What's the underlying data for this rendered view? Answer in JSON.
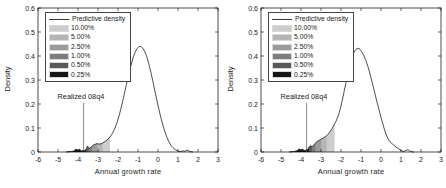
{
  "figure": {
    "background": "#ffffff",
    "text_color": "#1a1a1a"
  },
  "chart_data": [
    {
      "type": "line",
      "title": "",
      "xlabel": "Annual growth rate",
      "ylabel": "Density",
      "xlim": [
        -6,
        3
      ],
      "ylim": [
        0,
        0.6
      ],
      "xticks": [
        -6,
        -5,
        -4,
        -3,
        -2,
        -1,
        0,
        1,
        2,
        3
      ],
      "yticks": [
        0,
        0.1,
        0.2,
        0.3,
        0.4,
        0.5,
        0.6
      ],
      "grid": false,
      "legend": {
        "position": "upper-left",
        "line_label": "Predictive density",
        "bands": [
          {
            "label": "10.00%",
            "color": "#cdcdcd",
            "upper_x": -2.4
          },
          {
            "label": "5.00%",
            "color": "#b5b5b5",
            "upper_x": -2.78
          },
          {
            "label": "2.50%",
            "color": "#9b9b9b",
            "upper_x": -3.05
          },
          {
            "label": "1.00%",
            "color": "#7d7d7d",
            "upper_x": -3.3
          },
          {
            "label": "0.50%",
            "color": "#595959",
            "upper_x": -3.48
          },
          {
            "label": "0.25%",
            "color": "#161616",
            "upper_x": -3.62
          }
        ]
      },
      "annotation": {
        "text": "Realized 08q4",
        "x": -3.72,
        "line_top_y": 0.205
      },
      "curve": {
        "name": "Predictive density",
        "color": "#3a3a3a",
        "points": [
          [
            -4.6,
            0.0
          ],
          [
            -4.35,
            0.002
          ],
          [
            -4.2,
            0.004
          ],
          [
            -4.1,
            0.013
          ],
          [
            -4.0,
            0.006
          ],
          [
            -3.92,
            0.012
          ],
          [
            -3.85,
            0.004
          ],
          [
            -3.7,
            0.006
          ],
          [
            -3.6,
            0.01
          ],
          [
            -3.52,
            0.024
          ],
          [
            -3.45,
            0.014
          ],
          [
            -3.35,
            0.02
          ],
          [
            -3.25,
            0.028
          ],
          [
            -3.15,
            0.032
          ],
          [
            -3.05,
            0.035
          ],
          [
            -2.95,
            0.033
          ],
          [
            -2.85,
            0.034
          ],
          [
            -2.75,
            0.038
          ],
          [
            -2.65,
            0.044
          ],
          [
            -2.55,
            0.05
          ],
          [
            -2.45,
            0.058
          ],
          [
            -2.35,
            0.068
          ],
          [
            -2.25,
            0.082
          ],
          [
            -2.15,
            0.1
          ],
          [
            -2.05,
            0.122
          ],
          [
            -1.95,
            0.15
          ],
          [
            -1.85,
            0.182
          ],
          [
            -1.75,
            0.218
          ],
          [
            -1.65,
            0.255
          ],
          [
            -1.55,
            0.292
          ],
          [
            -1.45,
            0.328
          ],
          [
            -1.35,
            0.362
          ],
          [
            -1.25,
            0.392
          ],
          [
            -1.15,
            0.414
          ],
          [
            -1.05,
            0.43
          ],
          [
            -0.95,
            0.439
          ],
          [
            -0.85,
            0.44
          ],
          [
            -0.75,
            0.432
          ],
          [
            -0.65,
            0.416
          ],
          [
            -0.55,
            0.394
          ],
          [
            -0.45,
            0.364
          ],
          [
            -0.35,
            0.33
          ],
          [
            -0.25,
            0.292
          ],
          [
            -0.15,
            0.252
          ],
          [
            -0.05,
            0.213
          ],
          [
            0.05,
            0.176
          ],
          [
            0.15,
            0.141
          ],
          [
            0.25,
            0.11
          ],
          [
            0.35,
            0.083
          ],
          [
            0.45,
            0.06
          ],
          [
            0.55,
            0.042
          ],
          [
            0.65,
            0.028
          ],
          [
            0.75,
            0.018
          ],
          [
            0.85,
            0.011
          ],
          [
            0.95,
            0.006
          ],
          [
            1.05,
            0.003
          ],
          [
            1.15,
            0.002
          ],
          [
            1.25,
            0.005
          ],
          [
            1.35,
            0.003
          ],
          [
            1.45,
            0.008
          ],
          [
            1.55,
            0.004
          ],
          [
            1.65,
            0.001
          ],
          [
            1.75,
            0.0
          ]
        ]
      }
    },
    {
      "type": "line",
      "title": "",
      "xlabel": "Annual growth rate",
      "ylabel": "Density",
      "xlim": [
        -6,
        3
      ],
      "ylim": [
        0,
        0.6
      ],
      "xticks": [
        -6,
        -5,
        -4,
        -3,
        -2,
        -1,
        0,
        1,
        2,
        3
      ],
      "yticks": [
        0,
        0.1,
        0.2,
        0.3,
        0.4,
        0.5,
        0.6
      ],
      "grid": false,
      "legend": {
        "position": "upper-left",
        "line_label": "Predictive density",
        "bands": [
          {
            "label": "10.00%",
            "color": "#cdcdcd",
            "upper_x": -2.32
          },
          {
            "label": "5.00%",
            "color": "#b5b5b5",
            "upper_x": -2.72
          },
          {
            "label": "2.50%",
            "color": "#9b9b9b",
            "upper_x": -3.0
          },
          {
            "label": "1.00%",
            "color": "#7d7d7d",
            "upper_x": -3.28
          },
          {
            "label": "0.50%",
            "color": "#595959",
            "upper_x": -3.46
          },
          {
            "label": "0.25%",
            "color": "#161616",
            "upper_x": -3.6
          }
        ]
      },
      "annotation": {
        "text": "Realized 08q4",
        "x": -3.72,
        "line_top_y": 0.205
      },
      "curve": {
        "name": "Predictive density",
        "color": "#3a3a3a",
        "points": [
          [
            -4.6,
            0.0
          ],
          [
            -4.35,
            0.002
          ],
          [
            -4.2,
            0.005
          ],
          [
            -4.1,
            0.013
          ],
          [
            -4.0,
            0.007
          ],
          [
            -3.92,
            0.012
          ],
          [
            -3.85,
            0.006
          ],
          [
            -3.75,
            0.008
          ],
          [
            -3.65,
            0.012
          ],
          [
            -3.55,
            0.026
          ],
          [
            -3.45,
            0.022
          ],
          [
            -3.35,
            0.03
          ],
          [
            -3.25,
            0.04
          ],
          [
            -3.15,
            0.046
          ],
          [
            -3.05,
            0.051
          ],
          [
            -2.95,
            0.056
          ],
          [
            -2.85,
            0.06
          ],
          [
            -2.75,
            0.066
          ],
          [
            -2.65,
            0.074
          ],
          [
            -2.55,
            0.084
          ],
          [
            -2.45,
            0.097
          ],
          [
            -2.35,
            0.112
          ],
          [
            -2.25,
            0.128
          ],
          [
            -2.15,
            0.148
          ],
          [
            -2.05,
            0.175
          ],
          [
            -1.95,
            0.21
          ],
          [
            -1.85,
            0.25
          ],
          [
            -1.75,
            0.29
          ],
          [
            -1.65,
            0.328
          ],
          [
            -1.55,
            0.362
          ],
          [
            -1.45,
            0.392
          ],
          [
            -1.35,
            0.415
          ],
          [
            -1.25,
            0.428
          ],
          [
            -1.15,
            0.433
          ],
          [
            -1.05,
            0.428
          ],
          [
            -0.95,
            0.416
          ],
          [
            -0.85,
            0.4
          ],
          [
            -0.75,
            0.38
          ],
          [
            -0.65,
            0.355
          ],
          [
            -0.55,
            0.325
          ],
          [
            -0.45,
            0.293
          ],
          [
            -0.35,
            0.259
          ],
          [
            -0.25,
            0.225
          ],
          [
            -0.15,
            0.192
          ],
          [
            -0.05,
            0.16
          ],
          [
            0.05,
            0.129
          ],
          [
            0.15,
            0.1
          ],
          [
            0.25,
            0.075
          ],
          [
            0.35,
            0.055
          ],
          [
            0.45,
            0.042
          ],
          [
            0.55,
            0.035
          ],
          [
            0.65,
            0.028
          ],
          [
            0.75,
            0.021
          ],
          [
            0.85,
            0.015
          ],
          [
            0.95,
            0.009
          ],
          [
            1.05,
            0.004
          ],
          [
            1.15,
            0.002
          ],
          [
            1.25,
            0.007
          ],
          [
            1.35,
            0.01
          ],
          [
            1.45,
            0.003
          ],
          [
            1.55,
            0.001
          ],
          [
            1.65,
            0.0
          ]
        ]
      }
    }
  ]
}
